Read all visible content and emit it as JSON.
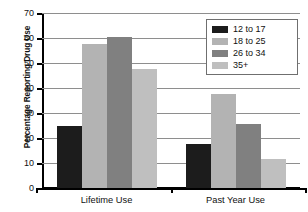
{
  "chart_data": {
    "type": "bar",
    "title": "",
    "xlabel": "",
    "ylabel": "Percentage Reporting Drug Use",
    "categories": [
      "Lifetime Use",
      "Past Year Use"
    ],
    "ylim": [
      0,
      70
    ],
    "yticks": [
      0,
      10,
      20,
      30,
      40,
      50,
      60,
      70
    ],
    "ytick_labels": [
      "0",
      "10",
      "20",
      "30",
      "40",
      "50",
      "60",
      "70"
    ],
    "grid": true,
    "legend_position": "top-right",
    "series": [
      {
        "name": "12 to 17",
        "color": "#1c1c1c",
        "values": [
          25.0,
          17.5
        ]
      },
      {
        "name": "18 to 25",
        "color": "#b3b3b3",
        "values": [
          57.5,
          37.5
        ]
      },
      {
        "name": "26 to 34",
        "color": "#808080",
        "values": [
          60.5,
          25.5
        ]
      },
      {
        "name": "35+",
        "color": "#bfbfbf",
        "values": [
          47.5,
          11.5
        ]
      }
    ]
  },
  "legend": {
    "entries": [
      {
        "label": "12 to 17"
      },
      {
        "label": "18 to 25"
      },
      {
        "label": "26 to 34"
      },
      {
        "label": "35+"
      }
    ]
  },
  "axes": {
    "y_title": "Percentage Reporting Drug Use",
    "y_labels": [
      "70",
      "60",
      "50",
      "40",
      "30",
      "20",
      "10",
      "0"
    ],
    "x_labels": [
      "Lifetime Use",
      "Past Year Use"
    ]
  },
  "colors": {
    "series_1": "#1c1c1c",
    "series_2": "#b3b3b3",
    "series_3": "#808080",
    "series_4": "#bfbfbf",
    "grid": "#8e8e8e",
    "axis": "#000000",
    "background": "#ffffff"
  }
}
